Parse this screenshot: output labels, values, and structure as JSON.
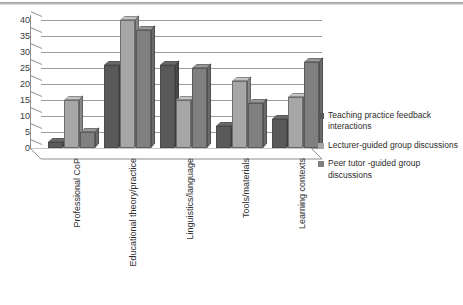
{
  "chart_data": {
    "type": "bar",
    "title": "",
    "subtitle": "",
    "xlabel": "",
    "ylabel": "",
    "ylim": [
      0,
      40
    ],
    "yticks": [
      0,
      5,
      10,
      15,
      20,
      25,
      30,
      35,
      40
    ],
    "grid": true,
    "legend_position": "right",
    "style": "3d-clustered-column",
    "categories": [
      "Professional CoP",
      "Educational theory/practice",
      "Linguistics/language",
      "Tools/materials",
      "Learning contexts"
    ],
    "series": [
      {
        "name": "Teaching practice feedback interactions",
        "color": "#595959",
        "values": [
          2,
          26,
          26,
          7,
          9
        ]
      },
      {
        "name": "Lecturer-guided group discussions",
        "color": "#a6a6a6",
        "values": [
          15,
          40,
          15,
          21,
          16
        ]
      },
      {
        "name": "Peer tutor -guided group discussions",
        "color": "#808080",
        "values": [
          5,
          37,
          25,
          14,
          27
        ]
      }
    ]
  },
  "legend": {
    "items": [
      {
        "label": "Teaching practice feedback interactions",
        "color": "#595959"
      },
      {
        "label": "Lecturer-guided group discussions",
        "color": "#a6a6a6"
      },
      {
        "label": "Peer tutor -guided group discussions",
        "color": "#808080"
      }
    ]
  },
  "axis": {
    "y_tick_labels": [
      "0",
      "5",
      "10",
      "15",
      "20",
      "25",
      "30",
      "35",
      "40"
    ],
    "x_tick_labels": [
      "Professional CoP",
      "Educational theory/practice",
      "Linguistics/language",
      "Tools/materials",
      "Learning contexts"
    ]
  }
}
